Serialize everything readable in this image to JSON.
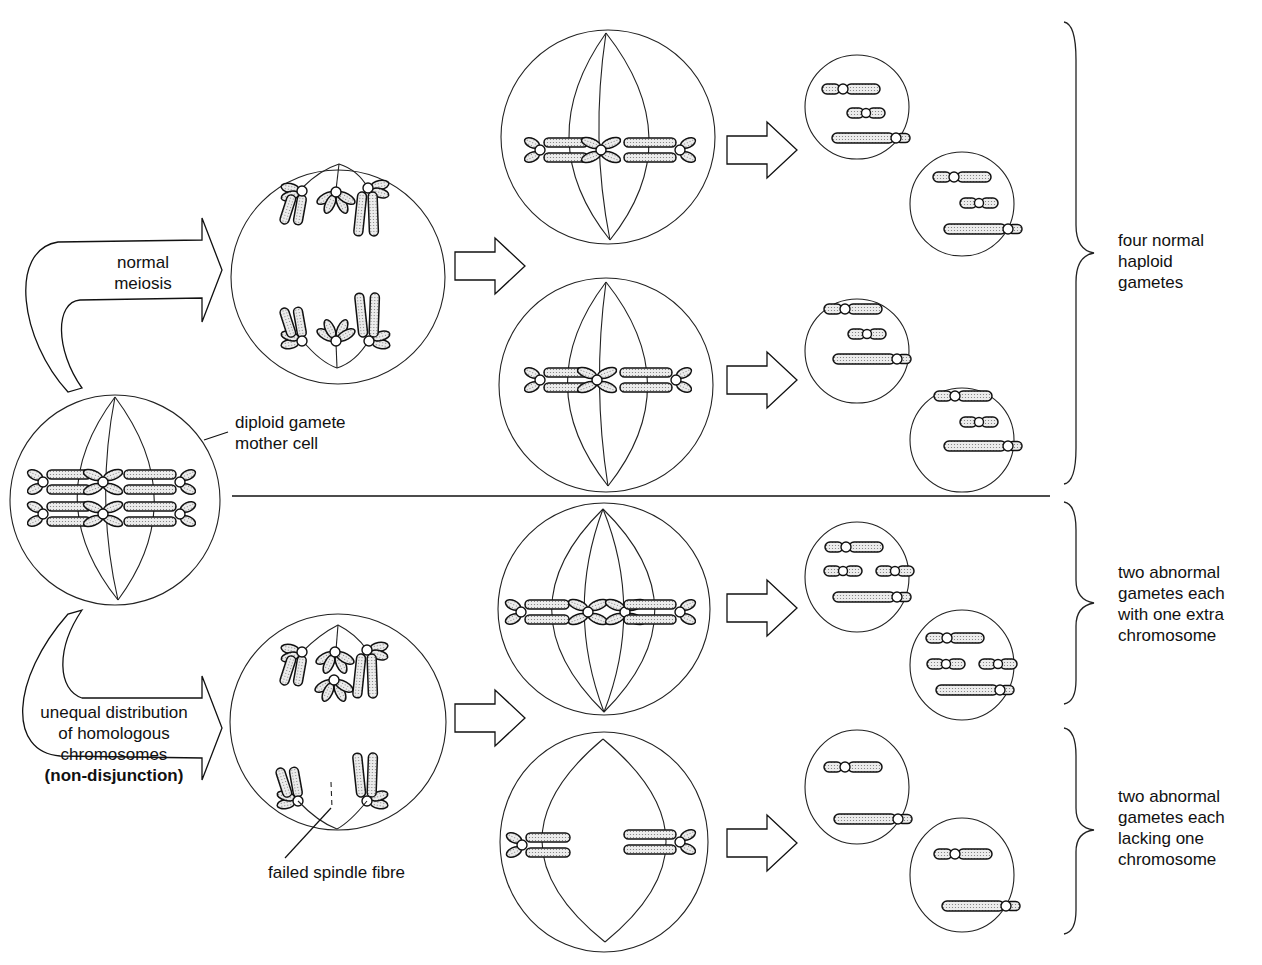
{
  "labels": {
    "normal_meiosis": [
      "normal",
      "meiosis"
    ],
    "mother_cell": [
      "diploid gamete",
      "mother cell"
    ],
    "non_disjunction": [
      "unequal distribution",
      "of homologous",
      "chromosomes"
    ],
    "non_disjunction_bold": "(non-disjunction)",
    "failed_spindle": "failed spindle fibre",
    "outcome_normal": [
      "four normal",
      "haploid",
      "gametes"
    ],
    "outcome_extra": [
      "two abnormal",
      "gametes each",
      "with one extra",
      "chromosome"
    ],
    "outcome_lacking": [
      "two abnormal",
      "gametes each",
      "lacking one",
      "chromosome"
    ]
  },
  "stages": {
    "mother_cell": {
      "chromosome_pairs": 3,
      "ploidy": "diploid"
    },
    "anaphase_I_normal": {
      "top_chromosomes": 3,
      "bottom_chromosomes": 3
    },
    "anaphase_I_nondisjunction": {
      "top_chromosomes": 4,
      "bottom_chromosomes": 2
    },
    "metaphase_II": [
      {
        "branch": "normal",
        "chromosomes": 3
      },
      {
        "branch": "normal",
        "chromosomes": 3
      },
      {
        "branch": "non-disjunction",
        "chromosomes": 4
      },
      {
        "branch": "non-disjunction",
        "chromosomes": 2
      }
    ],
    "gametes": [
      {
        "group": "normal",
        "chromosomes": 3
      },
      {
        "group": "normal",
        "chromosomes": 3
      },
      {
        "group": "normal",
        "chromosomes": 3
      },
      {
        "group": "normal",
        "chromosomes": 3
      },
      {
        "group": "extra",
        "chromosomes": 4
      },
      {
        "group": "extra",
        "chromosomes": 4
      },
      {
        "group": "lacking",
        "chromosomes": 2
      },
      {
        "group": "lacking",
        "chromosomes": 2
      }
    ]
  },
  "colors": {
    "stroke": "#111111",
    "chromosome_fill": "#d9d9d9",
    "background": "#ffffff"
  }
}
